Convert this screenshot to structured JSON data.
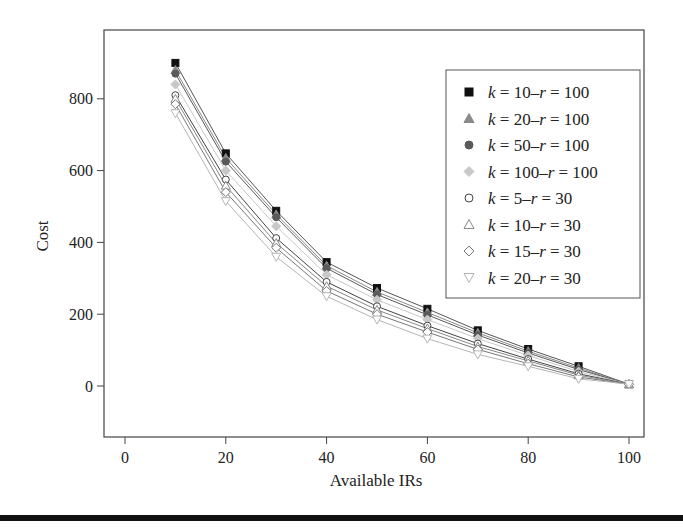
{
  "chart_data": {
    "type": "line",
    "title": "",
    "xlabel": "Available IRs",
    "ylabel": "Cost",
    "xlim": [
      0,
      100
    ],
    "ylim": [
      -140,
      1000
    ],
    "x_ticks": [
      0,
      20,
      40,
      60,
      80,
      100
    ],
    "y_ticks": [
      0,
      200,
      400,
      600,
      800
    ],
    "grid": false,
    "legend_position": "upper right",
    "x": [
      10,
      20,
      30,
      40,
      50,
      60,
      70,
      80,
      90,
      100
    ],
    "series": [
      {
        "name": "k = 10–r = 100",
        "k": "10",
        "r": "100",
        "marker": "square-filled",
        "color": "#111111",
        "values": [
          900,
          648,
          488,
          345,
          273,
          215,
          155,
          103,
          55,
          5
        ]
      },
      {
        "name": "k = 20–r = 100",
        "k": "20",
        "r": "100",
        "marker": "triangle-filled",
        "color": "#8a8a8a",
        "values": [
          880,
          635,
          478,
          335,
          262,
          205,
          148,
          97,
          50,
          5
        ]
      },
      {
        "name": "k = 50–r = 100",
        "k": "50",
        "r": "100",
        "marker": "circle-filled",
        "color": "#5a5a5a",
        "values": [
          870,
          625,
          470,
          328,
          255,
          198,
          142,
          92,
          46,
          5
        ]
      },
      {
        "name": "k = 100–r = 100",
        "k": "100",
        "r": "100",
        "marker": "diamond-filled",
        "color": "#c8c8c8",
        "values": [
          840,
          600,
          445,
          310,
          240,
          185,
          132,
          85,
          40,
          5
        ]
      },
      {
        "name": "k = 5–r = 30",
        "k": "5",
        "r": "30",
        "marker": "circle-open",
        "color": "#444444",
        "values": [
          810,
          575,
          412,
          290,
          222,
          168,
          118,
          75,
          34,
          5
        ]
      },
      {
        "name": "k = 10–r = 30",
        "k": "10",
        "r": "30",
        "marker": "triangle-open",
        "color": "#888888",
        "values": [
          800,
          558,
          398,
          278,
          212,
          160,
          110,
          70,
          30,
          5
        ]
      },
      {
        "name": "k = 15–r = 30",
        "k": "15",
        "r": "30",
        "marker": "diamond-open",
        "color": "#777777",
        "values": [
          785,
          540,
          385,
          265,
          200,
          150,
          102,
          62,
          25,
          5
        ]
      },
      {
        "name": "k = 20–r = 30",
        "k": "20",
        "r": "30",
        "marker": "triangle-down-open",
        "color": "#b5b5b5",
        "values": [
          760,
          515,
          360,
          250,
          185,
          132,
          88,
          55,
          20,
          5
        ]
      }
    ]
  }
}
